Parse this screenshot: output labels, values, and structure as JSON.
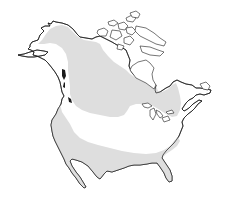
{
  "map": {
    "region": "North America",
    "layers": [
      {
        "name": "continent-outline",
        "style": "black coastline on white"
      },
      {
        "name": "range-northern",
        "description": "Alaska/Yukon through central Canada to Quebec/Great Lakes"
      },
      {
        "name": "range-southern",
        "description": "Pacific coast through southern United States to Atlantic coast"
      }
    ],
    "colors": {
      "background": "#ffffff",
      "land": "#ffffff",
      "outline": "#1a1a1a",
      "range_fill": "#dedede"
    }
  }
}
